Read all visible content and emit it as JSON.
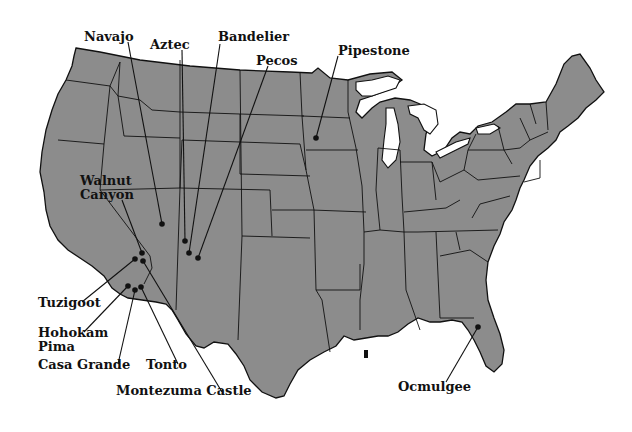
{
  "map": {
    "title": "",
    "land_color": "#8c8c8c",
    "border_color": "#111111",
    "water_color": "#ffffff",
    "sites": [
      {
        "name": "Navajo",
        "label": "Navajo",
        "label_pos": [
          80,
          32
        ],
        "dot": [
          162,
          224
        ]
      },
      {
        "name": "Aztec",
        "label": "Aztec",
        "label_pos": [
          150,
          40
        ],
        "dot": [
          185,
          241
        ]
      },
      {
        "name": "Bandelier",
        "label": "Bandelier",
        "label_pos": [
          218,
          30
        ],
        "dot": [
          189,
          253
        ]
      },
      {
        "name": "Pecos",
        "label": "Pecos",
        "label_pos": [
          256,
          54
        ],
        "dot": [
          198,
          258
        ]
      },
      {
        "name": "Pipestone",
        "label": "Pipestone",
        "label_pos": [
          338,
          50
        ],
        "dot": [
          316,
          138
        ]
      },
      {
        "name": "Walnut Canyon",
        "label": "Walnut\nCanyon",
        "label_pos": [
          80,
          174
        ],
        "dot": [
          142,
          253
        ]
      },
      {
        "name": "Tuzigoot",
        "label": "Tuzigoot",
        "label_pos": [
          38,
          296
        ],
        "dot": [
          135,
          259
        ]
      },
      {
        "name": "Hohokam Pima",
        "label": "Hohokam\nPima",
        "label_pos": [
          38,
          322
        ],
        "dot": [
          128,
          286
        ]
      },
      {
        "name": "Casa Grande",
        "label": "Casa Grande",
        "label_pos": [
          38,
          358
        ],
        "dot": [
          135,
          290
        ]
      },
      {
        "name": "Tonto",
        "label": "Tonto",
        "label_pos": [
          146,
          358
        ],
        "dot": [
          141,
          287
        ]
      },
      {
        "name": "Montezuma Castle",
        "label": "Montezuma Castle",
        "label_pos": [
          116,
          384
        ],
        "dot": [
          143,
          261
        ]
      },
      {
        "name": "Ocmulgee",
        "label": "Ocmulgee",
        "label_pos": [
          398,
          382
        ],
        "dot": [
          478,
          327
        ]
      }
    ]
  }
}
